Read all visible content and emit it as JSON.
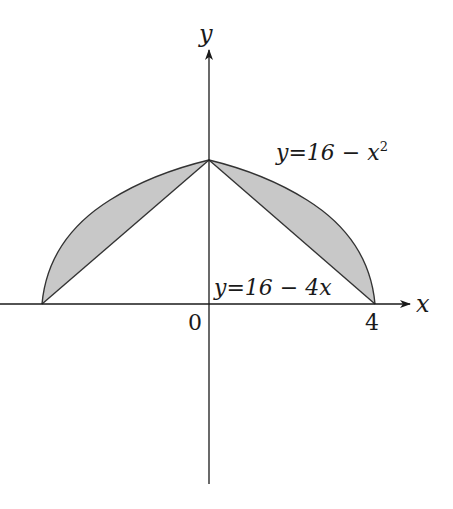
{
  "figure": {
    "axes": {
      "x_label": "x",
      "y_label": "y",
      "origin_label": "0",
      "x_tick_label": "4"
    },
    "curves": [
      {
        "name": "parabola",
        "equation_label_prefix": "y=16 − x",
        "equation_label_sup": "2"
      },
      {
        "name": "line",
        "equation_label": "y=16 − 4x"
      }
    ],
    "shaded_region": {
      "fill": "#c8c8c8",
      "description": "Region between y=16−x² and line segments from (±4,0) to (0,16)"
    },
    "colors": {
      "axis": "#1a1a1a",
      "curve": "#333333",
      "shade": "#c8c8c8"
    }
  }
}
